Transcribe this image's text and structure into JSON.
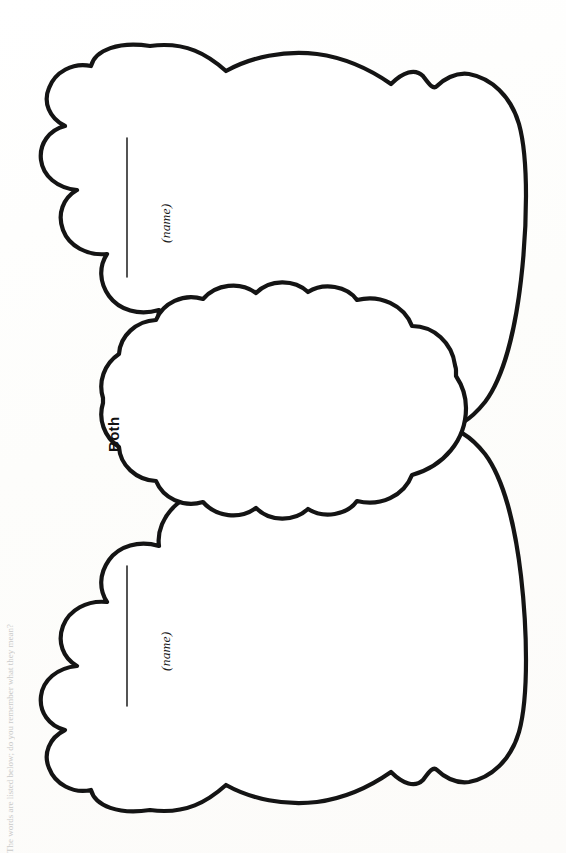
{
  "document": {
    "kind": "printable-worksheet",
    "title": "Cloud Venn Diagram",
    "orientation": "rotated-90-counterclockwise",
    "background_color": "#ffffff",
    "ink_color": "#141414",
    "edge_caption": "The words are listed below; do you remember what they mean?"
  },
  "diagram": {
    "type": "venn-two-circle",
    "shape_style": "cloud-scalloped",
    "left_circle": {
      "region_name": "first-topic-cloud",
      "name_label": "(name)",
      "write_line": true
    },
    "right_circle": {
      "region_name": "second-topic-cloud",
      "name_label": "(name)",
      "write_line": true
    },
    "overlap": {
      "region_name": "both-overlap-cloud",
      "label": "Both"
    }
  },
  "labels": {
    "name_top": "(name)",
    "name_bottom": "(name)",
    "both": "Both"
  }
}
